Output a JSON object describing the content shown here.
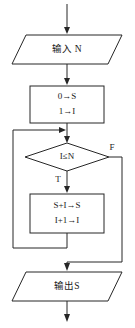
{
  "diagram": {
    "type": "flowchart",
    "colors": {
      "stroke": "#262626",
      "text": "#1a1a1a",
      "background": "#ffffff"
    },
    "nodes": {
      "input": {
        "shape": "parallelogram",
        "label": "输入 N"
      },
      "init": {
        "shape": "rectangle",
        "line1": "0→S",
        "line2": "1→I"
      },
      "decision": {
        "shape": "diamond",
        "label": "I≤N"
      },
      "body": {
        "shape": "rectangle",
        "line1": "S+I→S",
        "line2": "I+1→I"
      },
      "output": {
        "shape": "parallelogram",
        "label": "输出S"
      }
    },
    "branches": {
      "true_label": "T",
      "false_label": "F"
    }
  }
}
